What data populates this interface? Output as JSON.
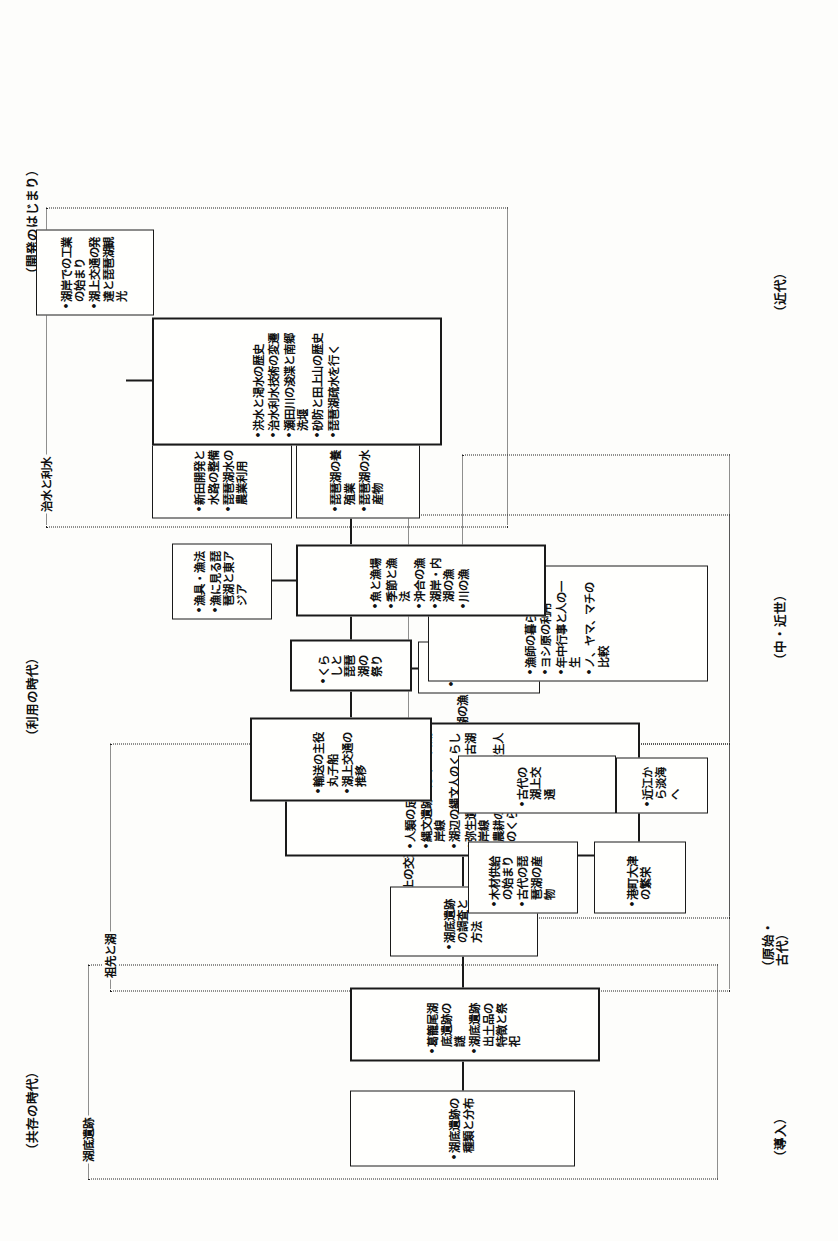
{
  "diagram": {
    "era_headers": [
      {
        "id": "era-kyozon",
        "label": "（共存の時代）"
      },
      {
        "id": "era-riyo",
        "label": "（利用の時代）"
      },
      {
        "id": "era-kaihatsu",
        "label": "（開発のはじまり）"
      }
    ],
    "stage_labels": [
      {
        "id": "stage-donyu",
        "label": "（導入）"
      },
      {
        "id": "stage-genshi",
        "line1": "（原始・",
        "line2": "古代）"
      },
      {
        "id": "stage-chukinsei",
        "label": "（中・近世）"
      },
      {
        "id": "stage-kindai",
        "label": "（近代）"
      }
    ],
    "group_labels": [
      {
        "id": "group-kotei-iseki",
        "label": "湖底遺跡"
      },
      {
        "id": "group-sosen-to-mizuumi",
        "label": "祖先と湖"
      },
      {
        "id": "group-kojo-no-kotsu",
        "label": "湖上の交通"
      },
      {
        "id": "group-mizuumi-no-ryo",
        "label": "湖の漁"
      },
      {
        "id": "group-chisui-to-risui",
        "label": "治水と利水"
      }
    ],
    "boxes": [
      {
        "id": "box-kotei-iseki-shurui",
        "items": [
          "湖底遺跡の種類と分布"
        ]
      },
      {
        "id": "box-tsuzurao",
        "items": [
          "葛籠尾湖底遺跡の謎",
          "湖底遺跡出土品の特徴と祭祀"
        ]
      },
      {
        "id": "box-chosa-hoho",
        "items": [
          "湖底遺跡の調査と方法"
        ]
      },
      {
        "id": "box-jinrui-ashiato",
        "items": [
          "人類の足跡",
          "縄文遺跡の分布と古湖岸線",
          "湖辺の縄文人のくらし",
          "弥生遺跡の分布と古湖岸線",
          "農耕の始まりと弥生人のくらし"
        ]
      },
      {
        "id": "box-omi-kara-afumi",
        "items": [
          "近江から淡海へ"
        ]
      },
      {
        "id": "box-mokuzai-kyokyu",
        "items": [
          "木材供給の始まり",
          "古代の琵琶湖の産物"
        ]
      },
      {
        "id": "box-kodai-kojo-kotsu",
        "items": [
          "古代の湖上交通"
        ]
      },
      {
        "id": "box-minatomachi-otsu",
        "items": [
          "港町大津の繁栄"
        ]
      },
      {
        "id": "box-yuso-shuyaku",
        "items": [
          "輸送の主役丸子船",
          "湖上交通の推移"
        ]
      },
      {
        "id": "box-jori-shoen",
        "items": [
          "条里, 荘園と村の発達"
        ]
      },
      {
        "id": "box-kurashi-to-biwako",
        "items": [
          "くらしと琵琶湖の祭り"
        ]
      },
      {
        "id": "box-ryoshi-no-kurashi",
        "items": [
          "漁師の暮らし",
          "ヨシ原の利用",
          "年中行事と人の一生",
          "ノ、ヤマ、マチの比較"
        ]
      },
      {
        "id": "box-sakana-to-gyojo",
        "items": [
          "魚と漁場",
          "季節と漁法",
          "沖合の漁",
          "湖岸・内湖の漁",
          "川の漁"
        ]
      },
      {
        "id": "box-gyogu-gyoho",
        "items": [
          "漁具・漁法",
          "漁に見る琵琶湖と東アジア"
        ]
      },
      {
        "id": "box-biwako-yoshoku",
        "items": [
          "琵琶湖の養殖業",
          "琵琶湖の水産物"
        ]
      },
      {
        "id": "box-shinden-kaihatsu",
        "items": [
          "新田開発と水路の整備",
          "琵琶湖水の農業利用"
        ]
      },
      {
        "id": "box-kozui-to-kassui",
        "items": [
          "洪水と渇水の歴史",
          "治水利水技術の変遷",
          "瀬田川の浚渫と南郷洗堰",
          "砂防と田上山の歴史",
          "琵琶湖疏水を行く"
        ]
      },
      {
        "id": "box-kogan-kogyo",
        "items": [
          "湖岸での工業の始まり",
          "湖上交通の発達と琵琶湖観光"
        ]
      }
    ]
  }
}
